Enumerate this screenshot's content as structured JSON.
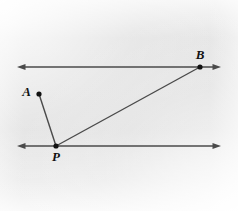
{
  "figure": {
    "canvas": {
      "width": 238,
      "height": 211
    },
    "background": {
      "page_color": "#ffffff",
      "panel_color": "#dddddd",
      "panel_light_corner_color": "#f4f4f4",
      "gradient_note": "light gray panel, lighter toward edges/corners"
    },
    "style": {
      "line_color": "#4a4a4a",
      "line_width": 1.4,
      "dot_color": "#111111",
      "dot_radius": 2.6,
      "label_color": "#111111",
      "label_font_size": 13
    },
    "lines": [
      {
        "name": "top-line",
        "kind": "double-arrow-line",
        "x1": 17,
        "y1": 67,
        "x2": 221,
        "y2": 67,
        "arrow_start": true,
        "arrow_end": true
      },
      {
        "name": "bottom-line",
        "kind": "double-arrow-line",
        "x1": 17,
        "y1": 146,
        "x2": 221,
        "y2": 146,
        "arrow_start": true,
        "arrow_end": true
      },
      {
        "name": "segment-A-P",
        "kind": "segment",
        "x1": 39,
        "y1": 94,
        "x2": 56,
        "y2": 146,
        "arrow_start": false,
        "arrow_end": false
      },
      {
        "name": "segment-P-B",
        "kind": "segment",
        "x1": 56,
        "y1": 146,
        "x2": 200,
        "y2": 67,
        "arrow_start": false,
        "arrow_end": false
      }
    ],
    "points": [
      {
        "id": "A",
        "label": "A",
        "x": 39,
        "y": 94,
        "label_x": 31,
        "label_y": 96
      },
      {
        "id": "B",
        "label": "B",
        "x": 200,
        "y": 67,
        "label_x": 200,
        "label_y": 59
      },
      {
        "id": "P",
        "label": "P",
        "x": 56,
        "y": 146,
        "label_x": 56,
        "label_y": 161
      }
    ]
  }
}
